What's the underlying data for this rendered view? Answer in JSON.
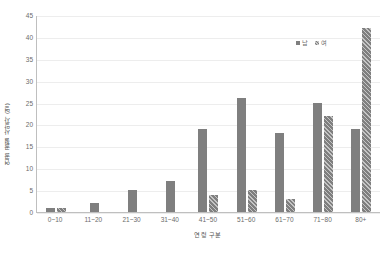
{
  "chart_data": {
    "type": "bar",
    "title": "",
    "subtitle": "",
    "xlabel": "연령 구분",
    "ylabel": "연골 골절 사망자 (명)",
    "categories": [
      "0~10",
      "11~20",
      "21~30",
      "31~40",
      "41~50",
      "51~60",
      "61~70",
      "71~80",
      "80+"
    ],
    "series": [
      {
        "name": "남",
        "values": [
          1,
          2,
          5,
          7,
          19,
          26,
          18,
          25,
          19
        ]
      },
      {
        "name": "여",
        "values": [
          1,
          0,
          0,
          0,
          4,
          5,
          3,
          22,
          42
        ]
      }
    ],
    "ylim": [
      0,
      45
    ],
    "yticks": [
      0,
      5,
      10,
      15,
      20,
      25,
      30,
      35,
      40,
      45
    ],
    "ytick_labels": [
      "0",
      "5",
      "10",
      "15",
      "20",
      "25",
      "30",
      "35",
      "40",
      "45"
    ],
    "grid": true,
    "grid_axis": "y",
    "legend_position": "top-right",
    "colors": {
      "male_bar": "#7f7f7f",
      "female_bar": "#7f7f7f",
      "gridline": "#ededed",
      "axis": "#bfbfbf",
      "tick_text": "#6b6b6b",
      "label_text": "#555555",
      "background": "#ffffff"
    },
    "female_bar_pattern": "diagonal-hatch"
  },
  "legend": {
    "items": [
      {
        "label": "남",
        "swatch": "solid-gray-swatch"
      },
      {
        "label": "여",
        "swatch": "hatched-gray-swatch"
      }
    ]
  }
}
